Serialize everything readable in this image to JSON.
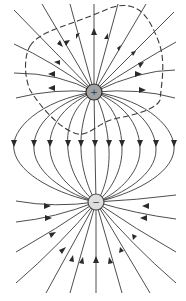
{
  "figure": {
    "colors": {
      "line": "#3a3a3a",
      "positive_fill": "#a2a2a2",
      "negative_fill": "#dedede",
      "background": "#ffffff"
    },
    "charges": [
      {
        "id": "positive",
        "sign": "+",
        "x": 94,
        "y": 92,
        "r": 8
      },
      {
        "id": "negative",
        "sign": "−",
        "x": 96,
        "y": 202,
        "r": 8
      }
    ],
    "surface": {
      "style": "dashed",
      "encloses": "positive"
    }
  },
  "caption": {
    "text": ""
  }
}
